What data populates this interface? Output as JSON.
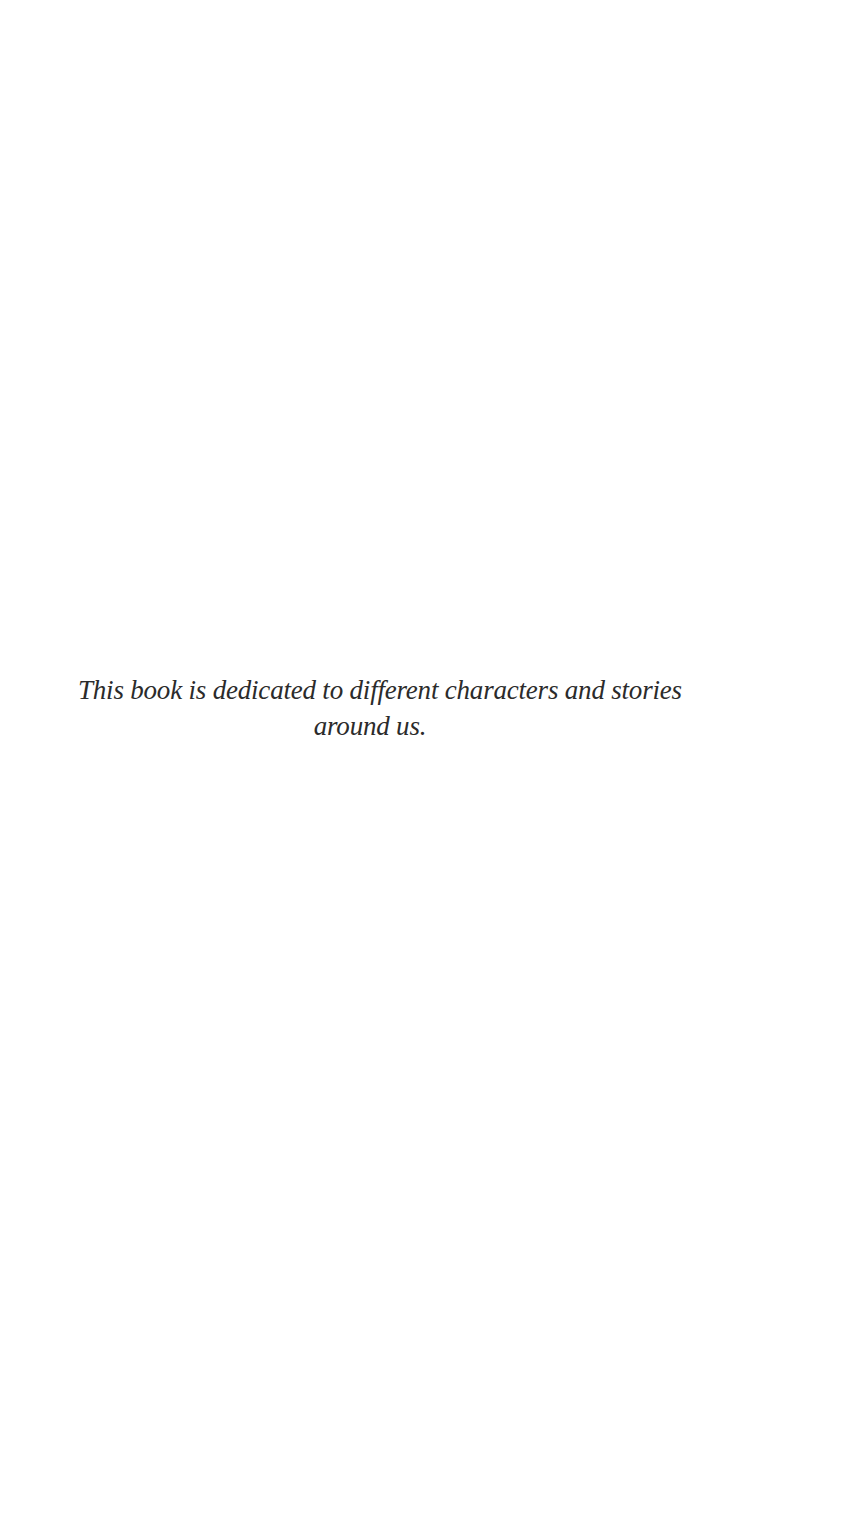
{
  "page": {
    "background": "#ffffff",
    "text_color": "#2b2b2b"
  },
  "dedication": {
    "lines": [
      "This book is dedicated to different characters and stories",
      "around us."
    ]
  }
}
